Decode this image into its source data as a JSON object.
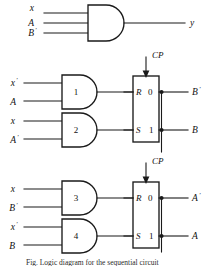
{
  "figure": {
    "caption": "Fig. Logic diagram for the sequential circuit",
    "ink_color": "#1a1a1a",
    "background_color": "#ffffff"
  },
  "output_gate": {
    "name": "output-and-gate",
    "type": "AND",
    "inputs": [
      {
        "label": "x",
        "prime": ""
      },
      {
        "label": "A",
        "prime": ""
      },
      {
        "label": "B",
        "prime": "'"
      }
    ],
    "output": {
      "label": "y",
      "prime": ""
    }
  },
  "gates": [
    {
      "number": "1",
      "type": "AND",
      "inputs": [
        {
          "label": "x",
          "prime": "'"
        },
        {
          "label": "A",
          "prime": ""
        }
      ],
      "drives": "flipflop-B-R"
    },
    {
      "number": "2",
      "type": "AND",
      "inputs": [
        {
          "label": "x",
          "prime": ""
        },
        {
          "label": "A",
          "prime": "'"
        }
      ],
      "drives": "flipflop-B-S"
    },
    {
      "number": "3",
      "type": "AND",
      "inputs": [
        {
          "label": "x",
          "prime": ""
        },
        {
          "label": "B",
          "prime": "'"
        }
      ],
      "drives": "flipflop-A-R"
    },
    {
      "number": "4",
      "type": "AND",
      "inputs": [
        {
          "label": "x",
          "prime": "'"
        },
        {
          "label": "B",
          "prime": ""
        }
      ],
      "drives": "flipflop-A-S"
    }
  ],
  "flipflops": [
    {
      "name": "flipflop-B",
      "clock": {
        "label": "CP"
      },
      "terminals": [
        {
          "input": "R",
          "state": "0",
          "output": {
            "label": "B",
            "prime": "'"
          }
        },
        {
          "input": "S",
          "state": "1",
          "output": {
            "label": "B",
            "prime": ""
          }
        }
      ]
    },
    {
      "name": "flipflop-A",
      "clock": {
        "label": "CP"
      },
      "terminals": [
        {
          "input": "R",
          "state": "0",
          "output": {
            "label": "A",
            "prime": "'"
          }
        },
        {
          "input": "S",
          "state": "1",
          "output": {
            "label": "A",
            "prime": ""
          }
        }
      ]
    }
  ]
}
